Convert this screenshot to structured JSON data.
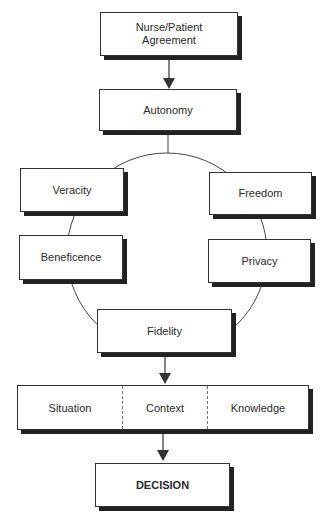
{
  "diagram": {
    "nodes": {
      "agreement": "Nurse/Patient Agreement",
      "autonomy": "Autonomy",
      "veracity": "Veracity",
      "freedom": "Freedom",
      "beneficence": "Beneficence",
      "privacy": "Privacy",
      "fidelity": "Fidelity",
      "decision": "DECISION"
    },
    "factors": [
      "Situation",
      "Context",
      "Knowledge"
    ],
    "edges": [
      {
        "from": "agreement",
        "to": "autonomy",
        "type": "arrow"
      },
      {
        "from": "autonomy",
        "to": "ethics-circle",
        "type": "line"
      },
      {
        "from": "fidelity",
        "to": "factors",
        "type": "arrow"
      },
      {
        "from": "factors",
        "to": "decision",
        "type": "arrow"
      }
    ],
    "circle_members": [
      "Veracity",
      "Freedom",
      "Beneficence",
      "Privacy",
      "Fidelity"
    ]
  }
}
